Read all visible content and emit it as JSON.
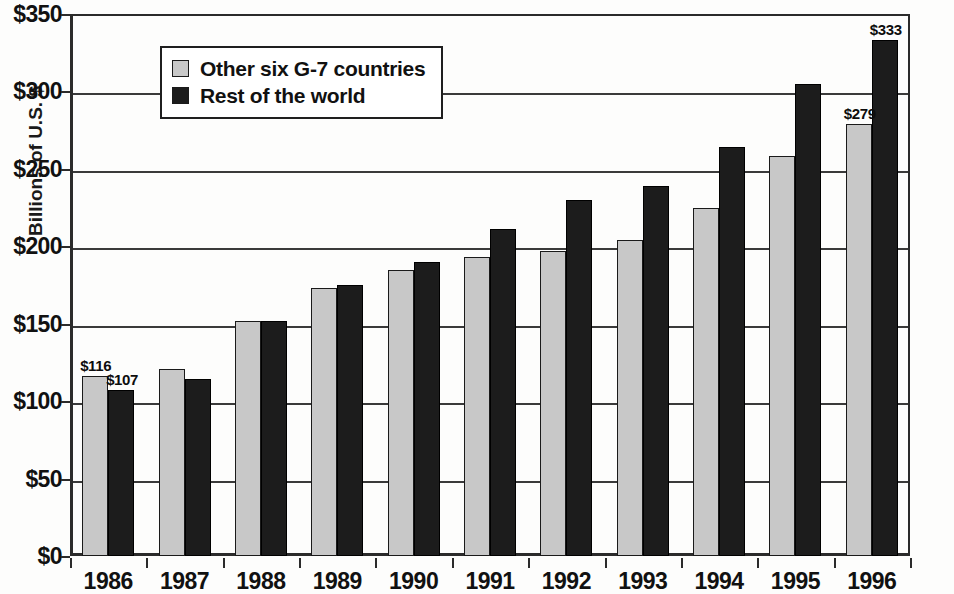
{
  "chart_data": {
    "type": "bar",
    "title": "",
    "xlabel": "",
    "ylabel": "Billions of U.S. $",
    "categories": [
      "1986",
      "1987",
      "1988",
      "1989",
      "1990",
      "1991",
      "1992",
      "1993",
      "1994",
      "1995",
      "1996"
    ],
    "series": [
      {
        "name": "Other six G-7 countries",
        "color": "#c8c8c8",
        "values": [
          116,
          121,
          152,
          173,
          185,
          193,
          197,
          204,
          225,
          258,
          279
        ]
      },
      {
        "name": "Rest of the world",
        "color": "#1c1c1c",
        "values": [
          107,
          114,
          152,
          175,
          190,
          211,
          230,
          239,
          264,
          305,
          333
        ]
      }
    ],
    "ylim": [
      0,
      350
    ],
    "yticks": [
      0,
      50,
      100,
      150,
      200,
      250,
      300,
      350
    ],
    "ytick_labels": [
      "$0",
      "$50",
      "$100",
      "$150",
      "$200",
      "$250",
      "$300",
      "$350"
    ],
    "grid": true,
    "legend_position": "top-left-inside",
    "data_labels": [
      {
        "category": "1986",
        "series": "Other six G-7 countries",
        "text": "$116"
      },
      {
        "category": "1986",
        "series": "Rest of the world",
        "text": "$107"
      },
      {
        "category": "1996",
        "series": "Other six G-7 countries",
        "text": "$279"
      },
      {
        "category": "1996",
        "series": "Rest of the world",
        "text": "$333"
      }
    ]
  },
  "legend": {
    "items": [
      {
        "label": "Other six G-7 countries"
      },
      {
        "label": "Rest of the world"
      }
    ]
  }
}
